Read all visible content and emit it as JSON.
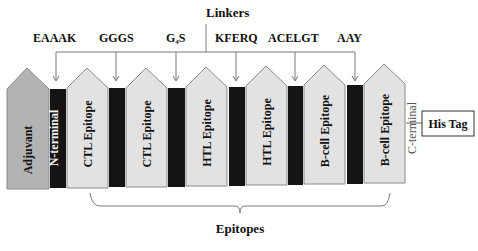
{
  "title": "Linkers",
  "linkers": [
    {
      "label": "EAAAK"
    },
    {
      "label": "GGGS"
    },
    {
      "label": "G4S",
      "base": "G",
      "sub": "4",
      "tail": "S"
    },
    {
      "label": "KFERQ"
    },
    {
      "label": "ACELGT"
    },
    {
      "label": "AAY"
    }
  ],
  "segments": [
    {
      "label": "Adjuvant",
      "type": "adjuvant"
    },
    {
      "label": "CTL Epitope",
      "type": "epitope"
    },
    {
      "label": "CTL Epitope",
      "type": "epitope"
    },
    {
      "label": "HTL Epitope",
      "type": "epitope"
    },
    {
      "label": "HTL Epitope",
      "type": "epitope"
    },
    {
      "label": "B-cell Epitope",
      "type": "epitope"
    },
    {
      "label": "B-cell Epitope",
      "type": "epitope"
    }
  ],
  "n_terminal": "N-terminal",
  "c_terminal": "C-terminal",
  "his_tag": "His Tag",
  "epitopes_label": "Epitopes",
  "colors": {
    "adjuvant": "#b3b3b3",
    "epitope": "#e2e2e2",
    "linker": "#141414",
    "outline": "#8a8a8a",
    "line": "#7a7a7a"
  }
}
